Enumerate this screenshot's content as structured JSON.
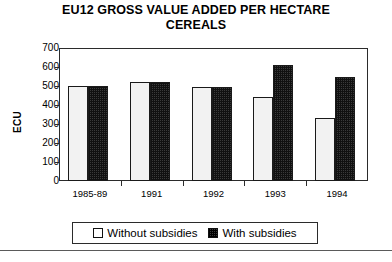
{
  "chart_data": {
    "type": "bar",
    "title": "EU12 GROSS VALUE ADDED PER HECTARE CEREALS",
    "title_line1": "EU12 GROSS VALUE ADDED PER HECTARE",
    "title_line2": "CEREALS",
    "xlabel": "",
    "ylabel": "ECU",
    "ylim": [
      0,
      700
    ],
    "ytick_step": 100,
    "yticks": [
      700,
      600,
      500,
      400,
      300,
      200,
      100,
      0
    ],
    "ytick_labels": [
      "700",
      "600",
      "500",
      "400",
      "300",
      "200",
      "100",
      "0"
    ],
    "categories": [
      "1985-89",
      "1991",
      "1992",
      "1993",
      "1994"
    ],
    "grid": false,
    "legend_position": "bottom",
    "series": [
      {
        "name": "Without subsidies",
        "fill": "white",
        "values": [
          500,
          520,
          495,
          440,
          330
        ]
      },
      {
        "name": "With subsidies",
        "fill": "dark-checker",
        "values": [
          500,
          520,
          495,
          610,
          550
        ]
      }
    ]
  },
  "legend": {
    "entries": [
      {
        "label": "Without subsidies"
      },
      {
        "label": "With subsidies"
      }
    ]
  },
  "colors": {
    "axis": "#2b2b2b",
    "bar_light": "#f2f2f2",
    "bar_dark": "#3a3a3a",
    "text": "#000000"
  }
}
